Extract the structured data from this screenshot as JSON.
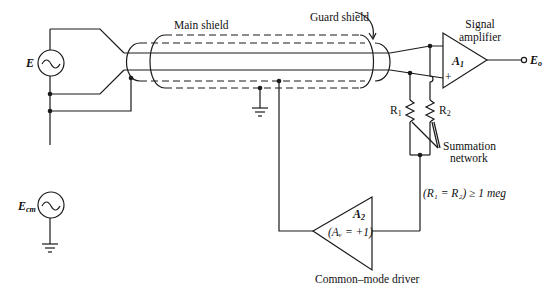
{
  "diagram": {
    "type": "circuit-schematic",
    "colors": {
      "ink": "#1a1a1a",
      "background": "#ffffff"
    },
    "labels": {
      "main_shield": "Main shield",
      "guard_shield": "Guard shield",
      "signal_amplifier_line1": "Signal",
      "signal_amplifier_line2": "amplifier",
      "source_e": "E",
      "source_ecm_main": "E",
      "source_ecm_sub": "cm",
      "amp1_main": "A",
      "amp1_sub": "1",
      "amp1_minus": "−",
      "amp1_plus": "+",
      "output_main": "E",
      "output_sub": "o",
      "r1_main": "R",
      "r1_sub": "1",
      "r2_main": "R",
      "r2_sub": "2",
      "summation_line1": "Summation",
      "summation_line2": "network",
      "resistor_condition": "(R₁ = R₂) ≥ 1 meg",
      "amp2_main": "A",
      "amp2_sub": "2",
      "amp2_gain": "(Aᵥ = +1)",
      "common_mode_driver": "Common–mode driver"
    },
    "components": [
      {
        "id": "E",
        "kind": "ac-source"
      },
      {
        "id": "Ecm",
        "kind": "ac-source"
      },
      {
        "id": "main-shield",
        "kind": "shield",
        "grounded": true
      },
      {
        "id": "guard-shield",
        "kind": "shield"
      },
      {
        "id": "A1",
        "kind": "op-amp",
        "role": "Signal amplifier"
      },
      {
        "id": "R1",
        "kind": "resistor"
      },
      {
        "id": "R2",
        "kind": "resistor"
      },
      {
        "id": "A2",
        "kind": "op-amp",
        "role": "Common-mode driver",
        "gain": "+1"
      }
    ]
  }
}
